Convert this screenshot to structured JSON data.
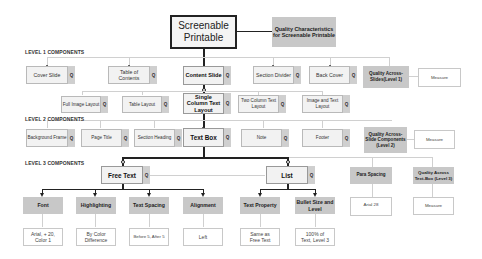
{
  "root": {
    "label": "Screenable Printable",
    "quality": "Quality Characteristics for Screenable Printable"
  },
  "levels": {
    "l1": "LEVEL 1 COMPONENTS",
    "l2": "LEVEL 2 COMPONENTS",
    "l3": "LEVEL 3 COMPONENTS"
  },
  "q": "Q",
  "level1": {
    "items": [
      "Cover Slide",
      "Table of Contents",
      "Content Slide",
      "Section Divider",
      "Back Cover"
    ],
    "quality": "Quality Across-Slides(Level 1)",
    "measure": "Measure"
  },
  "layouts": {
    "items": [
      "Full Image Layout",
      "Table Layout",
      "Single Column Text Layout",
      "Two Column Text Layout",
      "Image and Text Layout"
    ]
  },
  "level2": {
    "items": [
      "Background Frame",
      "Page Title",
      "Section Heading",
      "Text Box",
      "Note",
      "Footer"
    ],
    "quality": "Quality Across-Slide Components (Level 2)",
    "measure": "Measure"
  },
  "level3": {
    "items": [
      "Free Text",
      "List"
    ],
    "para_spacing": "Para Spacing",
    "para_spacing_value": "Arial 28",
    "quality": "Quality Across Text-Box (Level 3)",
    "measure": "Measure"
  },
  "properties": [
    {
      "label": "Font",
      "value": "Arial, + 20, Color 1"
    },
    {
      "label": "Highlighting",
      "value": "By Color Difference"
    },
    {
      "label": "Text Spacing",
      "value": "Before 5, After 5"
    },
    {
      "label": "Alignment",
      "value": "Left"
    },
    {
      "label": "Text Property",
      "value": "Same as Free Text"
    },
    {
      "label": "Bullet Size and Level",
      "value": "100% of Text, Level 3"
    }
  ],
  "colors": {
    "node_fill": "#f2f2f2",
    "quality_fill": "#c8c8c8",
    "q_tag": "#cfcfcf",
    "line_dark": "#222222",
    "line_light": "#d0d0d0"
  }
}
